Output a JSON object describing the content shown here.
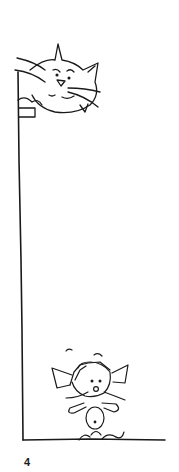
{
  "panel": {
    "description": "Comic panel: a large cat peeks over the top of a tall wall while a small cat stands at the bottom",
    "page_number": "4",
    "colors": {
      "ink": "#1a1a1a",
      "paper": "#ffffff"
    }
  }
}
